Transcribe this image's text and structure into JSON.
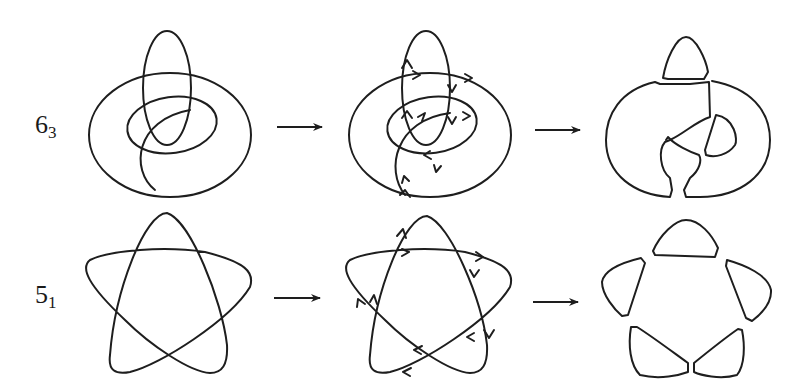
{
  "rows": [
    {
      "knot": {
        "base": "6",
        "sub": "3"
      },
      "stages": [
        "knot-diagram",
        "oriented-diagram",
        "seifert-regions"
      ]
    },
    {
      "knot": {
        "base": "5",
        "sub": "1"
      },
      "stages": [
        "knot-diagram",
        "oriented-diagram",
        "seifert-regions"
      ]
    }
  ],
  "colors": {
    "stroke": "#1e1e1e",
    "background": "#ffffff"
  }
}
